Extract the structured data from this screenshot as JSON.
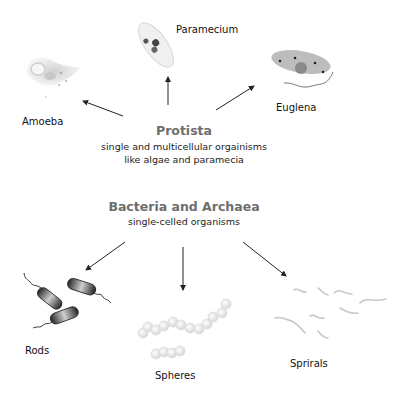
{
  "protista": {
    "title": "Protista",
    "description_line1": "single and multicellular orgainisms",
    "description_line2": "like algae and paramecia",
    "children": [
      {
        "label": "Amoeba"
      },
      {
        "label": "Paramecium"
      },
      {
        "label": "Euglena"
      }
    ]
  },
  "bacteria": {
    "title": "Bacteria and Archaea",
    "description": "single-celled organisms",
    "children": [
      {
        "label": "Rods"
      },
      {
        "label": "Spheres"
      },
      {
        "label": "Sprirals"
      }
    ]
  },
  "colors": {
    "heading": "#6e6e6e",
    "text": "#111111",
    "arrow": "#222222",
    "rod_fill": "#444444"
  }
}
